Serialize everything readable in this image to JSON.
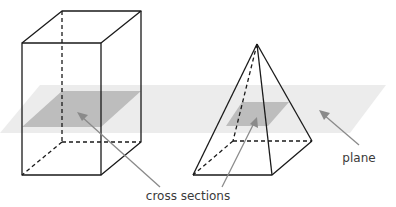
{
  "diagram": {
    "solids": [
      "rectangular prism",
      "square pyramid"
    ],
    "labels": {
      "cross_sections": "cross sections",
      "plane": "plane"
    },
    "colors": {
      "edge": "#1a1a1a",
      "plane": "#ececec",
      "cross_section": "#bdbdbd",
      "arrow": "#8a8a8a"
    }
  }
}
